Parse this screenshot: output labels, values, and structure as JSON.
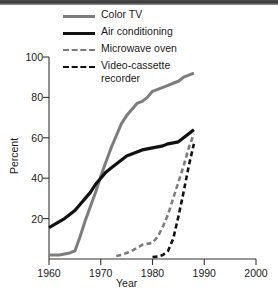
{
  "chart_data": {
    "type": "line",
    "title": "",
    "xlabel": "Year",
    "ylabel": "Percent",
    "xlim": [
      1960,
      2000
    ],
    "ylim": [
      0,
      100
    ],
    "xticks": [
      1960,
      1970,
      1980,
      1990,
      2000
    ],
    "yticks": [
      20,
      40,
      60,
      80,
      100
    ],
    "grid": false,
    "legend_position": "top-center",
    "series": [
      {
        "name": "Color TV",
        "color": "#7d7d7d",
        "style": "solid",
        "x": [
          1960,
          1961,
          1962,
          1963,
          1964,
          1965,
          1966,
          1967,
          1968,
          1969,
          1970,
          1971,
          1972,
          1973,
          1974,
          1975,
          1976,
          1977,
          1978,
          1979,
          1980,
          1981,
          1982,
          1983,
          1984,
          1985,
          1986,
          1987,
          1988
        ],
        "y": [
          2,
          2,
          2,
          2.5,
          3,
          4,
          11,
          19,
          26,
          33,
          41,
          48,
          55,
          61,
          67,
          71,
          74,
          77,
          78,
          80,
          83,
          84,
          85,
          86,
          87,
          88,
          90,
          91,
          92
        ]
      },
      {
        "name": "Air conditioning",
        "color": "#111111",
        "style": "solid",
        "x": [
          1960,
          1961,
          1962,
          1963,
          1964,
          1965,
          1966,
          1967,
          1968,
          1969,
          1970,
          1971,
          1972,
          1973,
          1974,
          1975,
          1976,
          1977,
          1978,
          1979,
          1980,
          1981,
          1982,
          1983,
          1984,
          1985,
          1986,
          1987,
          1988
        ],
        "y": [
          15.5,
          17,
          18.5,
          20,
          22,
          24,
          27,
          30,
          33,
          37,
          40,
          43,
          45,
          47,
          49,
          51,
          52,
          53,
          54,
          54.5,
          55,
          55.5,
          56,
          57,
          57.5,
          58,
          60,
          62,
          64
        ]
      },
      {
        "name": "Microwave oven",
        "color": "#7d7d7d",
        "style": "dashed",
        "x": [
          1973,
          1974,
          1975,
          1976,
          1977,
          1978,
          1979,
          1980,
          1981,
          1982,
          1983,
          1984,
          1985,
          1986,
          1987,
          1988
        ],
        "y": [
          1.5,
          2,
          3,
          4,
          5.5,
          7,
          7.5,
          8,
          11,
          16,
          22,
          30,
          38,
          46,
          55,
          62
        ]
      },
      {
        "name": "Video-cassette\nrecorder",
        "color": "#111111",
        "style": "dashed",
        "x": [
          1980,
          1981,
          1982,
          1983,
          1984,
          1985,
          1986,
          1987,
          1988
        ],
        "y": [
          1,
          1.2,
          2,
          4,
          10,
          21,
          33,
          46,
          57
        ]
      }
    ],
    "legend": [
      {
        "label": "Color TV",
        "color": "#7d7d7d",
        "style": "solid",
        "width": 3
      },
      {
        "label": "Air conditioning",
        "color": "#111111",
        "style": "solid",
        "width": 3.2
      },
      {
        "label": "Microwave oven",
        "color": "#7d7d7d",
        "style": "dashed",
        "width": 2.6
      },
      {
        "label": "Video-cassette\nrecorder",
        "color": "#111111",
        "style": "dashed",
        "width": 2.6
      }
    ],
    "axis_tick_labels": {
      "x": [
        "1960",
        "1970",
        "1980",
        "1990",
        "2000"
      ],
      "y": [
        "20",
        "40",
        "60",
        "80",
        "100"
      ]
    }
  }
}
